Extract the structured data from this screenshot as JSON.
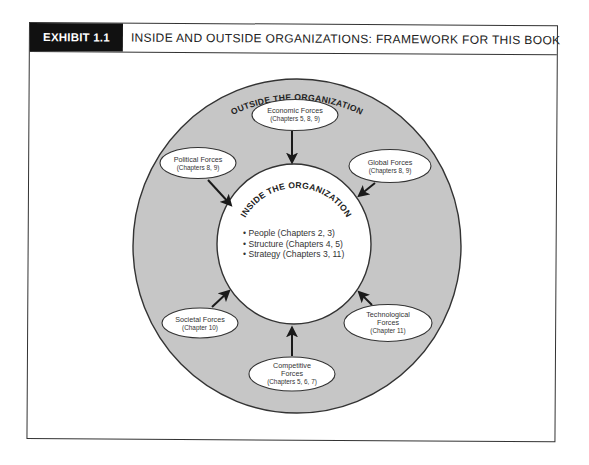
{
  "exhibit": {
    "label": "EXHIBIT 1.1",
    "title": "INSIDE AND OUTSIDE ORGANIZATIONS: FRAMEWORK FOR THIS BOOK"
  },
  "diagram": {
    "outer_label": "OUTSIDE THE ORGANIZATION",
    "inner_label": "INSIDE THE ORGANIZATION",
    "inner_items": [
      "• People (Chapters 2, 3)",
      "• Structure (Chapters 4, 5)",
      "• Strategy (Chapters 3, 11)"
    ],
    "forces": [
      {
        "id": "economic",
        "lines": [
          "Economic Forces"
        ],
        "chapters": "(Chapters 5, 8, 9)"
      },
      {
        "id": "political",
        "lines": [
          "Political Forces"
        ],
        "chapters": "(Chapters 8, 9)"
      },
      {
        "id": "global",
        "lines": [
          "Global Forces"
        ],
        "chapters": "(Chapters 8, 9)"
      },
      {
        "id": "societal",
        "lines": [
          "Societal Forces"
        ],
        "chapters": "(Chapter 10)"
      },
      {
        "id": "technological",
        "lines": [
          "Technological",
          "Forces"
        ],
        "chapters": "(Chapter 11)"
      },
      {
        "id": "competitive",
        "lines": [
          "Competitive",
          "Forces"
        ],
        "chapters": "(Chapters 5, 6, 7)"
      }
    ],
    "colors": {
      "outer_fill": "#c6c6c6",
      "inner_fill": "#ffffff",
      "stroke": "#333333",
      "label_bg": "#111111"
    }
  }
}
